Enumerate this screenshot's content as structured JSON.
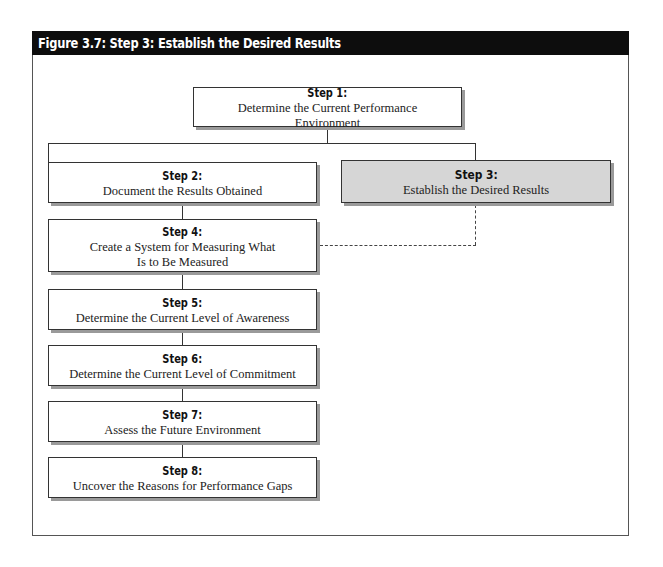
{
  "figure": {
    "title": "Figure 3.7: Step 3: Establish the Desired Results"
  },
  "steps": {
    "step1": {
      "label": "Step 1:",
      "desc": "Determine the Current Performance Environment"
    },
    "step2": {
      "label": "Step 2:",
      "desc": "Document the Results Obtained"
    },
    "step3": {
      "label": "Step 3:",
      "desc": "Establish the Desired Results",
      "highlighted": true
    },
    "step4": {
      "label": "Step 4:",
      "desc": "Create a System for Measuring What Is to Be Measured"
    },
    "step5": {
      "label": "Step 5:",
      "desc": "Determine the Current Level of Awareness"
    },
    "step6": {
      "label": "Step 6:",
      "desc": "Determine the Current Level of Commitment"
    },
    "step7": {
      "label": "Step 7:",
      "desc": "Assess the Future Environment"
    },
    "step8": {
      "label": "Step 8:",
      "desc": "Uncover the Reasons for Performance Gaps"
    }
  },
  "colors": {
    "title_bar": "#0d0d0d",
    "highlight_fill": "#d6d6d6",
    "box_border": "#333333",
    "shadow": "#9a9a9a"
  }
}
